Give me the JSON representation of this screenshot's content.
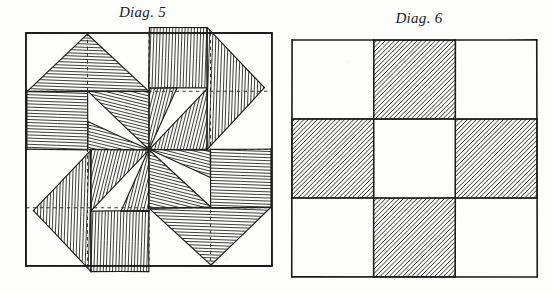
{
  "page": {
    "width": 553,
    "height": 294,
    "background_color": "#fdfdfb",
    "ink_color": "#1b1b1b"
  },
  "figures": [
    {
      "id": "diag-5",
      "caption": "Diag. 5",
      "kind": "quilt-block-diagram",
      "frame": {
        "x": 26,
        "y": 33,
        "width": 246,
        "height": 233
      },
      "caption_position": "top-center",
      "description": "Square block divided into four quadrants by dotted guide lines; each quadrant holds hatched triangles forming a pinwheel / star pattern",
      "guide_lines": {
        "style": "dashed",
        "vertical_fractions": [
          0.25,
          0.5,
          0.75
        ],
        "horizontal_fractions": [
          0.25,
          0.5,
          0.75
        ],
        "color": "#2a2a2a"
      },
      "hatching": {
        "direction": "horizontal-to-slight-diagonal",
        "spacing_px": 3.1,
        "line_width": 0.85,
        "color": "#1b1b1b"
      },
      "quadrants": [
        {
          "name": "top-left",
          "rotation_deg": 0,
          "pieces": 3
        },
        {
          "name": "top-right",
          "rotation_deg": 90,
          "pieces": 3
        },
        {
          "name": "bottom-right",
          "rotation_deg": 180,
          "pieces": 3
        },
        {
          "name": "bottom-left",
          "rotation_deg": 270,
          "pieces": 3
        }
      ],
      "piece_names": [
        "outer-corner-triangle",
        "inner-wing-triangle",
        "center-spike-triangle"
      ]
    },
    {
      "id": "diag-6",
      "caption": "Diag. 6",
      "kind": "nine-patch-diagram",
      "frame": {
        "x": 292,
        "y": 40,
        "width": 245,
        "height": 237
      },
      "caption_position": "top-center",
      "description": "Nine-patch square: 3 by 3 grid with the four edge-centre squares hatched, forming a plus / cross",
      "grid": {
        "rows": 3,
        "cols": 3
      },
      "hatching": {
        "direction": "diagonal-up-right",
        "spacing_px": 3.2,
        "line_width": 0.9,
        "color": "#1b1b1b"
      },
      "cells": [
        {
          "row": 0,
          "col": 0,
          "name": "cell-top-left",
          "filled": false
        },
        {
          "row": 0,
          "col": 1,
          "name": "cell-top-center",
          "filled": true
        },
        {
          "row": 0,
          "col": 2,
          "name": "cell-top-right",
          "filled": false
        },
        {
          "row": 1,
          "col": 0,
          "name": "cell-middle-left",
          "filled": true
        },
        {
          "row": 1,
          "col": 1,
          "name": "cell-middle-center",
          "filled": false
        },
        {
          "row": 1,
          "col": 2,
          "name": "cell-middle-right",
          "filled": true
        },
        {
          "row": 2,
          "col": 0,
          "name": "cell-bottom-left",
          "filled": false
        },
        {
          "row": 2,
          "col": 1,
          "name": "cell-bottom-center",
          "filled": true
        },
        {
          "row": 2,
          "col": 2,
          "name": "cell-bottom-right",
          "filled": false
        }
      ]
    }
  ]
}
